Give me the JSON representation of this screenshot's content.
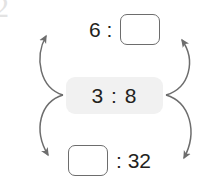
{
  "canvas": {
    "width": 207,
    "height": 184,
    "background": "#ffffff"
  },
  "artifact": {
    "glyph": "2",
    "color": "#e3e3e3"
  },
  "colors": {
    "text": "#231f20",
    "box_border": "#6d6d6d",
    "arrow": "#6d6d6d",
    "pill_background": "#f1f1f1"
  },
  "equivalent_ratios": {
    "top_row": {
      "left_value": "6 :",
      "right_value": "",
      "right_is_blank_box": true
    },
    "given_ratio": {
      "text": "3 : 8"
    },
    "bottom_row": {
      "left_value": "",
      "left_is_blank_box": true,
      "right_value": ": 32"
    }
  },
  "arrows": [
    {
      "name": "arrow-center-to-top-left",
      "direction": "up-right"
    },
    {
      "name": "arrow-center-to-bottom-left",
      "direction": "down-right"
    },
    {
      "name": "arrow-center-to-top-right",
      "direction": "up-left"
    },
    {
      "name": "arrow-center-to-bottom-right",
      "direction": "down-left"
    }
  ]
}
